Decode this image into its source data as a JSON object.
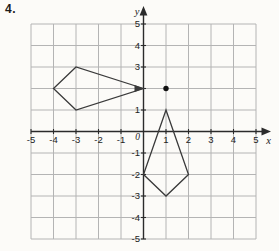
{
  "figure": {
    "problem_number": "4."
  },
  "colors": {
    "background": "#fcfbf8",
    "grid": "#b4b4b4",
    "axis": "#2b2b2b",
    "shape": "#3a3a3a",
    "point": "#111111",
    "label": "#222222"
  },
  "chart_data": {
    "type": "scatter",
    "title": "",
    "xlabel": "x",
    "ylabel": "y",
    "origin_label": "0",
    "xlim": [
      -5,
      5
    ],
    "ylim": [
      -5,
      5
    ],
    "grid": true,
    "x_ticks": [
      -5,
      -4,
      -3,
      -2,
      -1,
      1,
      2,
      3,
      4,
      5
    ],
    "y_ticks": [
      5,
      4,
      3,
      1,
      -1,
      -2,
      -3,
      -4,
      -5
    ],
    "polygons": [
      {
        "name": "kite-quadrilateral-left",
        "vertices": [
          [
            0,
            2
          ],
          [
            -3,
            3
          ],
          [
            -4,
            2
          ],
          [
            -3,
            1
          ]
        ],
        "tip_arrow_at": [
          0,
          2
        ]
      },
      {
        "name": "kite-quadrilateral-rotated",
        "vertices": [
          [
            1,
            1
          ],
          [
            0,
            -2
          ],
          [
            1,
            -3
          ],
          [
            2,
            -2
          ]
        ]
      }
    ],
    "points": [
      {
        "name": "rotation-center-point",
        "x": 1,
        "y": 2
      }
    ]
  }
}
